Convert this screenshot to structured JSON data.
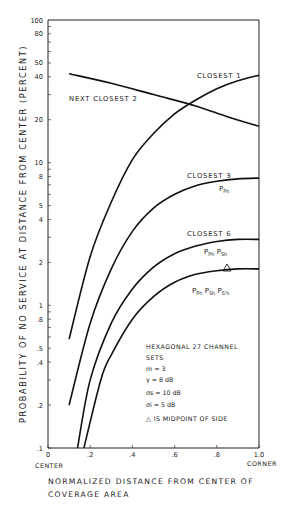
{
  "chart_data": {
    "type": "line",
    "title": "",
    "xlabel": "NORMALIZED DISTANCE FROM CENTER OF COVERAGE AREA",
    "xlabel_lines": [
      "NORMALIZED DISTANCE FROM CENTER OF",
      "COVERAGE AREA"
    ],
    "ylabel": "PROBABILITY OF NO SERVICE AT DISTANCE FROM CENTER (PERCENT)",
    "yscale": "log",
    "xlim": [
      0,
      1.0
    ],
    "ylim": [
      0.1,
      100
    ],
    "x_ticks": [
      {
        "value": 0,
        "label": "0"
      },
      {
        "value": 0.2,
        "label": ".2"
      },
      {
        "value": 0.4,
        "label": ".4"
      },
      {
        "value": 0.6,
        "label": ".6"
      },
      {
        "value": 0.8,
        "label": ".8"
      },
      {
        "value": 1.0,
        "label": "1.0"
      }
    ],
    "x_tick_sublabels": {
      "start": "CENTER",
      "end": "CORNER"
    },
    "y_ticks": [
      {
        "value": 100,
        "label": "100"
      },
      {
        "value": 80,
        "label": "80"
      },
      {
        "value": 50,
        "label": "50"
      },
      {
        "value": 40,
        "label": "40"
      },
      {
        "value": 20,
        "label": "20"
      },
      {
        "value": 10,
        "label": "10"
      },
      {
        "value": 8,
        "label": "8"
      },
      {
        "value": 5,
        "label": "5"
      },
      {
        "value": 4,
        "label": "4"
      },
      {
        "value": 2,
        "label": "2"
      },
      {
        "value": 1,
        "label": "1"
      },
      {
        "value": 0.8,
        "label": ".8"
      },
      {
        "value": 0.5,
        "label": ".5"
      },
      {
        "value": 0.4,
        "label": ".4"
      },
      {
        "value": 0.2,
        "label": ".2"
      },
      {
        "value": 0.1,
        "label": ".1"
      }
    ],
    "grid": false,
    "series": [
      {
        "name": "NEXT CLOSEST 2",
        "x": [
          0.1,
          0.3,
          0.5,
          0.7,
          0.85,
          1.0
        ],
        "y": [
          42,
          36,
          30,
          25,
          21,
          18
        ]
      },
      {
        "name": "CLOSEST 1",
        "x": [
          0.1,
          0.2,
          0.3,
          0.4,
          0.5,
          0.6,
          0.7,
          0.8,
          0.9,
          1.0
        ],
        "y": [
          0.58,
          2.2,
          5.3,
          10.5,
          16,
          22,
          27.5,
          33,
          37.5,
          41
        ]
      },
      {
        "name": "CLOSEST 3",
        "x": [
          0.1,
          0.2,
          0.3,
          0.4,
          0.5,
          0.6,
          0.7,
          0.8,
          0.9,
          1.0
        ],
        "y": [
          0.2,
          0.75,
          1.8,
          3.3,
          4.8,
          6.0,
          6.9,
          7.4,
          7.7,
          7.8
        ],
        "annotation": "P_Ph"
      },
      {
        "name": "CLOSEST 6",
        "x": [
          0.14,
          0.2,
          0.3,
          0.4,
          0.5,
          0.6,
          0.7,
          0.8,
          0.9,
          1.0
        ],
        "y": [
          0.1,
          0.3,
          0.75,
          1.3,
          1.85,
          2.3,
          2.6,
          2.8,
          2.9,
          2.9
        ],
        "annotation": "P_Ph P_Sh"
      },
      {
        "name": "CLOSEST 6 (all)",
        "x": [
          0.17,
          0.25,
          0.3,
          0.4,
          0.5,
          0.6,
          0.7,
          0.8,
          0.9,
          1.0
        ],
        "y": [
          0.1,
          0.3,
          0.45,
          0.8,
          1.15,
          1.45,
          1.65,
          1.75,
          1.8,
          1.8
        ],
        "annotation": "P_Ph P_Sh P_S'h"
      }
    ],
    "markers": [
      {
        "symbol": "triangle",
        "x": 0.82,
        "y": 1.95,
        "meaning": "MIDPOINT OF SIDE"
      }
    ],
    "curve_labels": [
      {
        "text": "CLOSEST 1"
      },
      {
        "text": "NEXT CLOSEST 2"
      },
      {
        "text": "CLOSEST 3"
      },
      {
        "text": "CLOSEST 6"
      }
    ],
    "annotation_labels": {
      "closest3": "Ph",
      "closest6": [
        "Ph",
        "Sh"
      ],
      "all": [
        "Ph",
        "Sh",
        "S'h"
      ]
    },
    "legend_box": {
      "lines": [
        "HEXAGONAL  27  CHANNEL",
        "SETS",
        "m = 3",
        "γ = 8 dB",
        "σs = 10 dB",
        "σi = 5 dB",
        "△ IS MIDPOINT OF SIDE"
      ]
    }
  }
}
